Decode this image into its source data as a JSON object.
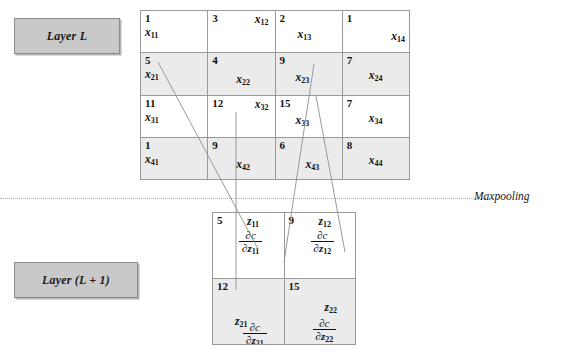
{
  "labels": {
    "layer_l": "Layer L",
    "layer_l_plus_1": "Layer (L + 1)",
    "maxpooling": "Maxpooling"
  },
  "upper_grid": {
    "name": "layer-L-activation-matrix",
    "rows": 4,
    "cols": 4,
    "cells": [
      {
        "value": "1",
        "symbol": "x",
        "sub": "11",
        "shaded": false,
        "pos": "sym-p0"
      },
      {
        "value": "3",
        "symbol": "x",
        "sub": "12",
        "shaded": false,
        "pos": "sym-p1"
      },
      {
        "value": "2",
        "symbol": "x",
        "sub": "13",
        "shaded": false,
        "pos": "sym-p2"
      },
      {
        "value": "1",
        "symbol": "x",
        "sub": "14",
        "shaded": false,
        "pos": "sym-p3"
      },
      {
        "value": "5",
        "symbol": "x",
        "sub": "21",
        "shaded": true,
        "pos": "sym-p0"
      },
      {
        "value": "4",
        "symbol": "x",
        "sub": "22",
        "shaded": true,
        "pos": "sym-p4"
      },
      {
        "value": "9",
        "symbol": "x",
        "sub": "23",
        "shaded": true,
        "pos": "sym-p5"
      },
      {
        "value": "7",
        "symbol": "x",
        "sub": "24",
        "shaded": true,
        "pos": "sym-p6"
      },
      {
        "value": "11",
        "symbol": "x",
        "sub": "31",
        "shaded": false,
        "pos": "sym-p0"
      },
      {
        "value": "12",
        "symbol": "x",
        "sub": "32",
        "shaded": false,
        "pos": "sym-p1"
      },
      {
        "value": "15",
        "symbol": "x",
        "sub": "33",
        "shaded": false,
        "pos": "sym-p5"
      },
      {
        "value": "7",
        "symbol": "x",
        "sub": "34",
        "shaded": false,
        "pos": "sym-p6"
      },
      {
        "value": "1",
        "symbol": "x",
        "sub": "41",
        "shaded": true,
        "pos": "sym-p0"
      },
      {
        "value": "9",
        "symbol": "x",
        "sub": "42",
        "shaded": true,
        "pos": "sym-p4"
      },
      {
        "value": "6",
        "symbol": "x",
        "sub": "43",
        "shaded": true,
        "pos": "sym-p7"
      },
      {
        "value": "8",
        "symbol": "x",
        "sub": "44",
        "shaded": true,
        "pos": "sym-p6"
      }
    ]
  },
  "lower_grid": {
    "name": "layer-L-plus-1-pooled-matrix",
    "rows": 2,
    "cols": 2,
    "cells": [
      {
        "value": "5",
        "symbol": "z",
        "sub": "11",
        "shaded": false,
        "grad_num": "∂c",
        "grad_den_symbol": "∂z",
        "grad_den_sub": "11"
      },
      {
        "value": "9",
        "symbol": "z",
        "sub": "12",
        "shaded": false,
        "grad_num": "∂c",
        "grad_den_symbol": "∂z",
        "grad_den_sub": "12"
      },
      {
        "value": "12",
        "symbol": "z",
        "sub": "21",
        "shaded": true,
        "grad_num": "∂c",
        "grad_den_symbol": "∂z",
        "grad_den_sub": "21"
      },
      {
        "value": "15",
        "symbol": "z",
        "sub": "22",
        "shaded": true,
        "grad_num": "∂c",
        "grad_den_symbol": "∂z",
        "grad_den_sub": "22"
      }
    ]
  },
  "colors": {
    "grid_line": "#9a9a9a",
    "shaded_cell": "#ebebeb",
    "layer_box_fill": "#c9c9c9",
    "connector_line": "#8f8f8f",
    "divider": "#b0b0b0"
  }
}
